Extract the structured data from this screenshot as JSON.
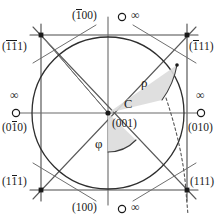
{
  "figure": {
    "type": "crystallographic-gnomonic-projection",
    "center": {
      "point_label": "C",
      "pole_label": "(001)",
      "x": 108,
      "y": 113
    },
    "circle": {
      "cx": 108,
      "cy": 113,
      "r": 76
    },
    "frame": {
      "x1": 41,
      "y1": 35,
      "x2": 187,
      "y2": 190
    },
    "angles": [
      {
        "name": "rho",
        "symbol": "ρ",
        "x": 145,
        "y": 82
      },
      {
        "name": "phi",
        "symbol": "φ",
        "x": 98,
        "y": 140
      }
    ],
    "colors": {
      "line": "#3c3c3c",
      "text": "#1a1a1a",
      "sector_fill": "#d8d8d8",
      "circle": "#2e2e2e"
    },
    "poles": [
      {
        "id": "top",
        "index_prefix": "(",
        "index_bar": "1",
        "index_rest": "00)",
        "infinity": "∞",
        "marker": "open-circle"
      },
      {
        "id": "bottom",
        "index_prefix": "(",
        "index_bar": "",
        "index_rest": "100)",
        "infinity": "∞",
        "marker": "open-circle"
      },
      {
        "id": "left",
        "index_prefix": "(0",
        "index_bar": "1",
        "index_rest": "0)",
        "infinity": "∞",
        "marker": "open-circle"
      },
      {
        "id": "right",
        "index_prefix": "(0",
        "index_bar": "",
        "index_rest": "10)",
        "infinity": "∞",
        "marker": "open-circle"
      }
    ],
    "corners": [
      {
        "id": "top-left",
        "p1": "(",
        "b1": "1",
        "b2": "1",
        "rest": "1)",
        "marker": "filled-square"
      },
      {
        "id": "top-right",
        "p1": "(",
        "b1": "1",
        "b2": "",
        "rest": "11)",
        "marker": "filled-square"
      },
      {
        "id": "bottom-left",
        "p1": "(1",
        "b1": "1",
        "b2": "",
        "rest": "1)",
        "marker": "filled-square"
      },
      {
        "id": "bottom-right",
        "p1": "(",
        "b1": "",
        "b2": "",
        "rest": "111)",
        "marker": "filled-square"
      }
    ]
  }
}
